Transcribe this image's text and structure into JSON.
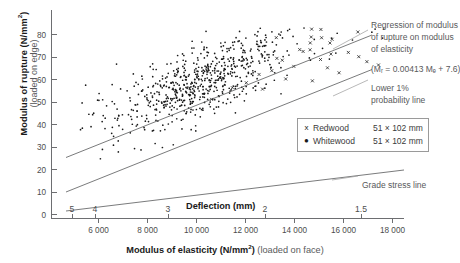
{
  "chart_data": {
    "type": "scatter",
    "title": "",
    "xlabel": "Modulus of elasticity (N/mm2) (loaded on face)",
    "xlabel_bold": "Modulus of elasticity (N/mm",
    "xlabel_sup": "2",
    "xlabel_bold_tail": ")",
    "xlabel_light": " (loaded on face)",
    "ylabel": "Modulus of rupture (N/mm2)",
    "ylabel_main_pre": "Modulus of rupture (N/mm",
    "ylabel_main_sup": "2",
    "ylabel_main_post": ")",
    "ylabel_sub": "(loaded on edge)",
    "xlim": [
      4000,
      19200
    ],
    "ylim": [
      0,
      88
    ],
    "xticks": [
      6000,
      8000,
      10000,
      12000,
      14000,
      16000,
      18000
    ],
    "xtick_labels": [
      "6 000",
      "8 000",
      "10 000",
      "12 000",
      "14 000",
      "16 000",
      "18 000"
    ],
    "yticks": [
      0,
      10,
      20,
      30,
      40,
      50,
      60,
      70,
      80
    ],
    "ytick_labels": [
      "0",
      "10",
      "20",
      "30",
      "40",
      "50",
      "60",
      "70",
      "80"
    ],
    "secondary_axis": {
      "label": "Deflection (mm)",
      "ticks": [
        5,
        4,
        3,
        2,
        1.5
      ],
      "tick_labels": [
        "5",
        "4",
        "3",
        "2",
        "1.5"
      ],
      "tick_x_values": [
        5400,
        6600,
        10250,
        14200,
        18100
      ]
    },
    "grid": false,
    "legend_position": "right-middle",
    "legend": [
      {
        "marker": "x",
        "name": "Redwood",
        "size": "51 × 102 mm"
      },
      {
        "marker": "●",
        "name": "Whitewood",
        "size": "51 × 102 mm"
      }
    ],
    "series": [
      {
        "name": "Redwood 51 x 102 mm",
        "marker": "x",
        "points": [
          [
            14850,
            70.5
          ],
          [
            15150,
            71.2
          ],
          [
            13950,
            66.8
          ],
          [
            16050,
            69.4
          ],
          [
            15600,
            67.1
          ],
          [
            14450,
            64.2
          ],
          [
            16800,
            70.1
          ],
          [
            17250,
            68.3
          ],
          [
            13500,
            62.4
          ],
          [
            12950,
            60.8
          ],
          [
            15900,
            63.6
          ],
          [
            17600,
            66.2
          ],
          [
            14100,
            58.9
          ],
          [
            16400,
            61.5
          ],
          [
            12400,
            57.3
          ],
          [
            11800,
            55.2
          ],
          [
            18100,
            64.8
          ],
          [
            13100,
            54.6
          ],
          [
            15250,
            58.1
          ],
          [
            10900,
            50.3
          ]
        ]
      },
      {
        "name": "Whitewood 51 x 102 mm",
        "marker": "dot",
        "points": [
          [
            10400,
            46.5
          ],
          [
            10800,
            48.2
          ],
          [
            11200,
            47.1
          ],
          [
            9800,
            44.3
          ],
          [
            10100,
            45.8
          ],
          [
            11600,
            50.4
          ],
          [
            9400,
            42.1
          ],
          [
            12000,
            51.3
          ],
          [
            10600,
            49.0
          ],
          [
            11000,
            46.2
          ],
          [
            9200,
            40.8
          ],
          [
            12400,
            52.6
          ],
          [
            8800,
            39.4
          ],
          [
            12800,
            54.1
          ],
          [
            10200,
            43.7
          ],
          [
            11400,
            48.9
          ],
          [
            8400,
            37.2
          ],
          [
            13200,
            55.0
          ],
          [
            9600,
            41.5
          ],
          [
            10000,
            44.9
          ]
        ]
      }
    ],
    "lines": [
      {
        "name": "Regression of modulus of rupture on modulus of elasticity",
        "label_lines": [
          "Regression of modulus",
          "of rupture on modulus",
          "of elasticity"
        ],
        "equation": "(Mᵣ = 0.00413 Mₑ + 7.6)",
        "slope": 0.00413,
        "intercept": 7.6,
        "x_range": [
          4600,
          19000
        ]
      },
      {
        "name": "Lower 1% probability line",
        "label_lines": [
          "Lower 1%",
          "probability line"
        ],
        "slope": 0.00413,
        "intercept": -8.0,
        "x_range": [
          4600,
          19000
        ]
      },
      {
        "name": "Grade stress line",
        "label_lines": [
          "Grade stress line"
        ],
        "slope": 0.00138,
        "intercept": -1.2,
        "x_range": [
          4600,
          19000
        ]
      }
    ]
  }
}
